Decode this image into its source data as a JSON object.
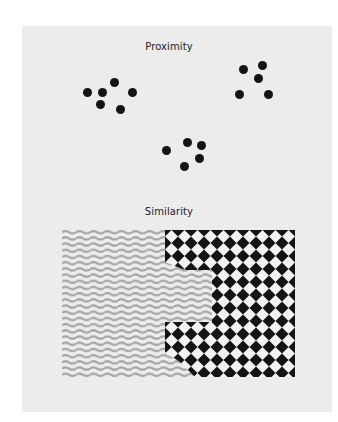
{
  "figure": {
    "background": "#ffffff",
    "panel_color": "#ececec",
    "sections": [
      {
        "title": "Proximity",
        "title_y": 46,
        "dot_color": "#141414",
        "dot_groups": [
          {
            "name": "left-cluster",
            "dots": [
              [
                87,
                92
              ],
              [
                102,
                92
              ],
              [
                114,
                82
              ],
              [
                132,
                92
              ],
              [
                100,
                104
              ],
              [
                120,
                109
              ]
            ]
          },
          {
            "name": "right-cluster",
            "dots": [
              [
                243,
                69
              ],
              [
                262,
                65
              ],
              [
                258,
                78
              ],
              [
                239,
                94
              ],
              [
                268,
                94
              ]
            ]
          },
          {
            "name": "bottom-cluster",
            "dots": [
              [
                166,
                150
              ],
              [
                187,
                142
              ],
              [
                201,
                145
              ],
              [
                199,
                158
              ],
              [
                184,
                166
              ]
            ]
          }
        ]
      },
      {
        "title": "Similarity",
        "title_y": 211,
        "wave_color": "#a6a6a6",
        "checker_dark": "#141414",
        "checker_light": "#f2f2f2",
        "pattern_box": {
          "x": 62,
          "y": 230,
          "width": 233,
          "height": 147
        }
      }
    ]
  }
}
